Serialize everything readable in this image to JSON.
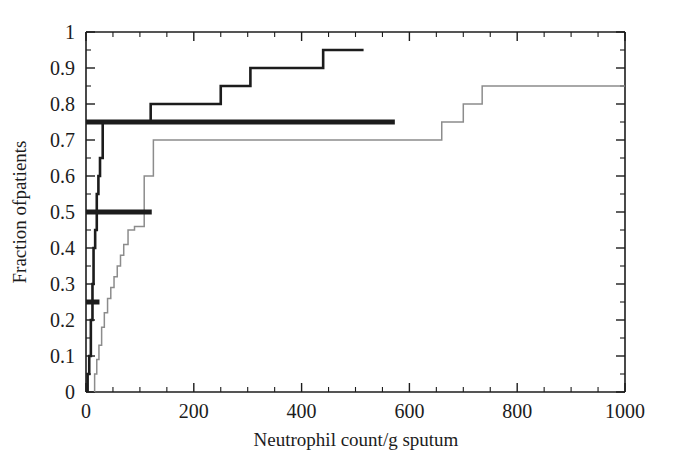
{
  "figure": {
    "name": "cumulative-distribution-neutrophil-count",
    "background_color": "#ffffff",
    "ink_color": "#1c1c1c"
  },
  "chart_data": {
    "type": "line",
    "title": "",
    "subtitle": "",
    "xlabel": "Neutrophil count/g sputum",
    "ylabel": "Fraction ofpatients",
    "xlim": [
      0,
      1000
    ],
    "ylim": [
      0,
      1
    ],
    "grid": false,
    "legend": "none",
    "xticks": [
      0,
      200,
      400,
      600,
      800,
      1000
    ],
    "xtick_labels": [
      "0",
      "200",
      "400",
      "600",
      "800",
      "1000"
    ],
    "x_minor_tick_interval": 50,
    "yticks": [
      0,
      0.1,
      0.2,
      0.3,
      0.4,
      0.5,
      0.6,
      0.7,
      0.8,
      0.9,
      1
    ],
    "ytick_labels": [
      "0",
      "0.1",
      "0.2",
      "0.3",
      "0.4",
      "0.5",
      "0.6",
      "0.7",
      "0.8",
      "0.9",
      "1"
    ],
    "y_minor_tick_interval": 0.05,
    "series": [
      {
        "name": "dark-step-curve",
        "style": "step-post",
        "color": "#1c1c1c",
        "line_width": 2.6,
        "x": [
          3,
          3,
          6,
          6,
          9,
          9,
          12,
          12,
          14,
          14,
          17,
          17,
          20,
          20,
          23,
          23,
          26,
          26,
          31,
          31,
          120,
          120,
          250,
          250,
          305,
          305,
          440,
          440,
          515
        ],
        "y": [
          0,
          0.05,
          0.05,
          0.1,
          0.1,
          0.2,
          0.2,
          0.3,
          0.3,
          0.4,
          0.4,
          0.45,
          0.45,
          0.55,
          0.55,
          0.6,
          0.6,
          0.65,
          0.65,
          0.75,
          0.75,
          0.8,
          0.8,
          0.85,
          0.85,
          0.9,
          0.9,
          0.95,
          0.95
        ]
      },
      {
        "name": "light-step-curve",
        "style": "step-post",
        "color": "#8c8c8c",
        "line_width": 1.5,
        "x": [
          16,
          16,
          20,
          20,
          24,
          24,
          29,
          29,
          34,
          34,
          40,
          40,
          46,
          46,
          52,
          52,
          58,
          58,
          64,
          64,
          70,
          70,
          78,
          78,
          90,
          90,
          108,
          108,
          125,
          125,
          660,
          660,
          700,
          700,
          735,
          735,
          1000
        ],
        "y": [
          0,
          0.05,
          0.05,
          0.09,
          0.09,
          0.13,
          0.13,
          0.18,
          0.18,
          0.22,
          0.22,
          0.26,
          0.26,
          0.29,
          0.29,
          0.32,
          0.32,
          0.35,
          0.35,
          0.38,
          0.38,
          0.41,
          0.41,
          0.45,
          0.45,
          0.46,
          0.46,
          0.6,
          0.6,
          0.7,
          0.7,
          0.75,
          0.75,
          0.8,
          0.8,
          0.85,
          0.85
        ]
      }
    ],
    "annotations": [
      {
        "name": "range-bar-upper-quartile",
        "type": "horizontal-bar",
        "y": 0.75,
        "x_start": 0,
        "x_end": 573,
        "color": "#1c1c1c",
        "line_width": 5
      },
      {
        "name": "range-bar-median",
        "type": "horizontal-bar",
        "y": 0.5,
        "x_start": 0,
        "x_end": 122,
        "color": "#1c1c1c",
        "line_width": 5
      },
      {
        "name": "range-bar-lower-quartile",
        "type": "horizontal-bar",
        "y": 0.25,
        "x_start": 0,
        "x_end": 25,
        "color": "#1c1c1c",
        "line_width": 5
      }
    ]
  }
}
